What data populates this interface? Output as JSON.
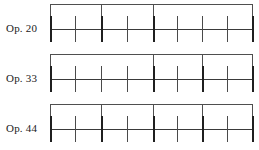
{
  "figure": {
    "type": "phrase-structure-diagram",
    "background_color": "#ffffff",
    "ink_color": "#2b2b2b",
    "width": 259,
    "height": 150,
    "rows": [
      {
        "label": "Op. 20",
        "baseline_y": 29,
        "tick_count": 9,
        "ticks": [
          {
            "index": 1,
            "x": 50,
            "weight": "major"
          },
          {
            "index": 2,
            "x": 75,
            "weight": "minor"
          },
          {
            "index": 3,
            "x": 101,
            "weight": "major"
          },
          {
            "index": 4,
            "x": 127,
            "weight": "minor"
          },
          {
            "index": 5,
            "x": 153,
            "weight": "major"
          },
          {
            "index": 6,
            "x": 177,
            "weight": "minor"
          },
          {
            "index": 7,
            "x": 202,
            "weight": "minor"
          },
          {
            "index": 8,
            "x": 227,
            "weight": "minor"
          },
          {
            "index": 9,
            "x": 252,
            "weight": "major"
          }
        ],
        "bracket_y": 4,
        "bracket_spans": [
          {
            "from_x": 50,
            "to_x": 101
          },
          {
            "from_x": 101,
            "to_x": 153
          },
          {
            "from_x": 153,
            "to_x": 252
          }
        ]
      },
      {
        "label": "Op. 33",
        "baseline_y": 79,
        "tick_count": 9,
        "ticks": [
          {
            "index": 1,
            "x": 50,
            "weight": "major"
          },
          {
            "index": 2,
            "x": 75,
            "weight": "minor"
          },
          {
            "index": 3,
            "x": 101,
            "weight": "minor"
          },
          {
            "index": 4,
            "x": 127,
            "weight": "minor"
          },
          {
            "index": 5,
            "x": 153,
            "weight": "major"
          },
          {
            "index": 6,
            "x": 177,
            "weight": "minor"
          },
          {
            "index": 7,
            "x": 202,
            "weight": "major"
          },
          {
            "index": 8,
            "x": 227,
            "weight": "minor"
          },
          {
            "index": 9,
            "x": 252,
            "weight": "major"
          }
        ],
        "bracket_y": 54,
        "bracket_spans": [
          {
            "from_x": 50,
            "to_x": 153
          },
          {
            "from_x": 153,
            "to_x": 202
          },
          {
            "from_x": 202,
            "to_x": 252
          }
        ]
      },
      {
        "label": "Op. 44",
        "baseline_y": 129,
        "tick_count": 9,
        "ticks": [
          {
            "index": 1,
            "x": 50,
            "weight": "major"
          },
          {
            "index": 2,
            "x": 75,
            "weight": "minor"
          },
          {
            "index": 3,
            "x": 101,
            "weight": "major"
          },
          {
            "index": 4,
            "x": 127,
            "weight": "minor"
          },
          {
            "index": 5,
            "x": 153,
            "weight": "major"
          },
          {
            "index": 6,
            "x": 177,
            "weight": "minor"
          },
          {
            "index": 7,
            "x": 202,
            "weight": "major"
          },
          {
            "index": 8,
            "x": 227,
            "weight": "minor"
          },
          {
            "index": 9,
            "x": 252,
            "weight": "major"
          }
        ],
        "bracket_y": 104,
        "bracket_spans": [
          {
            "from_x": 50,
            "to_x": 101
          },
          {
            "from_x": 101,
            "to_x": 153
          },
          {
            "from_x": 153,
            "to_x": 202
          },
          {
            "from_x": 202,
            "to_x": 252
          }
        ]
      }
    ]
  }
}
